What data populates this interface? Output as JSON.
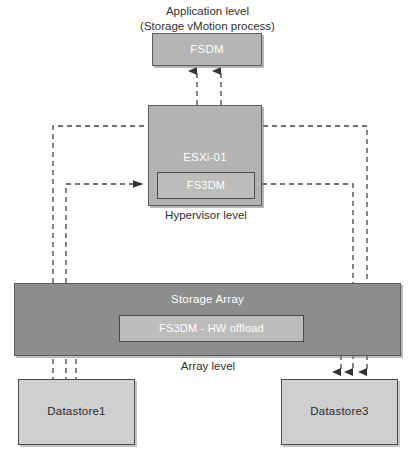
{
  "diagram": {
    "title_line1": "Application level",
    "title_line2": "(Storage vMotion process)",
    "levels": {
      "hypervisor": "Hypervisor level",
      "array": "Array level"
    },
    "nodes": {
      "fsdm": "FSDM",
      "esxi": "ESXi-01",
      "fs3dm": "FS3DM",
      "storage_array": "Storage Array",
      "hw_offload": "FS3DM - HW offload",
      "datastore1": "Datastore1",
      "datastore3": "Datastore3"
    },
    "colors": {
      "fsdm_fill": "#b5b5b5",
      "esxi_fill": "#b3b3b3",
      "inner_fill": "#bcbcbc",
      "array_fill": "#8d8d8d",
      "datastore_fill": "#cfcfcf",
      "stroke": "#4a4a4a",
      "text_dark": "#2f2f2f",
      "text_light": "#ffffff"
    }
  }
}
